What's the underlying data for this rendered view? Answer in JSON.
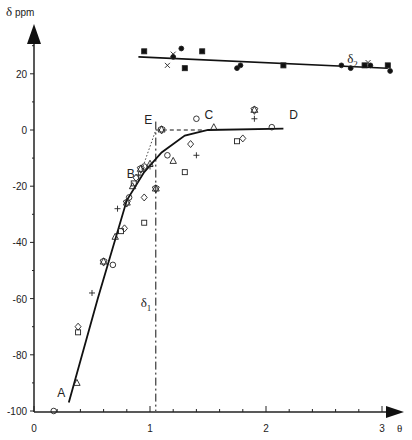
{
  "chart_data": {
    "type": "scatter",
    "title": "",
    "xlabel": "θ",
    "ylabel": "δ ppm",
    "xlim": [
      0,
      3.2
    ],
    "ylim": [
      -100,
      30
    ],
    "x_ticks": [
      "0",
      "1",
      "2",
      "3"
    ],
    "y_ticks": [
      "20",
      "0",
      "-20",
      "-40",
      "-60",
      "-80",
      "-100"
    ],
    "grid": false,
    "annotations": [
      {
        "label": "A",
        "x": 0.2,
        "y": -95
      },
      {
        "label": "B",
        "x": 0.8,
        "y": -17
      },
      {
        "label": "C",
        "x": 1.47,
        "y": 4
      },
      {
        "label": "D",
        "x": 2.2,
        "y": 4
      },
      {
        "label": "E",
        "x": 0.95,
        "y": 2
      },
      {
        "label": "δ1",
        "x": 0.92,
        "y": -63
      },
      {
        "label": "δ2",
        "x": 2.7,
        "y": 24
      }
    ],
    "series": [
      {
        "name": "δ1 fit",
        "kind": "line",
        "points": [
          [
            0.3,
            -97
          ],
          [
            0.55,
            -60
          ],
          [
            0.8,
            -25
          ],
          [
            0.95,
            -15
          ],
          [
            1.1,
            -8
          ],
          [
            1.3,
            -2
          ],
          [
            1.5,
            0
          ],
          [
            2.15,
            0.5
          ]
        ]
      },
      {
        "name": "δ2 fit",
        "kind": "line",
        "points": [
          [
            0.9,
            26
          ],
          [
            3.05,
            22
          ]
        ]
      },
      {
        "name": "extrapolation dashed",
        "kind": "line",
        "points": [
          [
            1.05,
            0
          ],
          [
            1.45,
            0
          ]
        ]
      },
      {
        "name": "E vertical dash-dot",
        "kind": "line",
        "points": [
          [
            1.05,
            3
          ],
          [
            1.05,
            -100
          ]
        ]
      },
      {
        "name": "δ1 data",
        "kind": "scatter",
        "points": [
          [
            0.17,
            -100
          ],
          [
            0.37,
            -90
          ],
          [
            0.38,
            -72
          ],
          [
            0.38,
            -70
          ],
          [
            0.5,
            -58
          ],
          [
            0.6,
            -47
          ],
          [
            0.68,
            -48
          ],
          [
            0.7,
            -38
          ],
          [
            0.75,
            -36
          ],
          [
            0.78,
            -35
          ],
          [
            0.72,
            -28
          ],
          [
            0.8,
            -26
          ],
          [
            0.82,
            -24
          ],
          [
            0.85,
            -20
          ],
          [
            0.86,
            -19
          ],
          [
            0.88,
            -17
          ],
          [
            0.9,
            -16
          ],
          [
            0.92,
            -14
          ],
          [
            0.95,
            -13
          ],
          [
            1.0,
            -12
          ],
          [
            0.95,
            -33
          ],
          [
            0.95,
            -24
          ],
          [
            1.0,
            -13
          ],
          [
            1.05,
            -21
          ],
          [
            1.15,
            -9
          ],
          [
            1.2,
            -11
          ],
          [
            1.3,
            -15
          ],
          [
            1.35,
            -5
          ],
          [
            1.4,
            -9
          ],
          [
            1.1,
            0
          ],
          [
            1.4,
            4
          ],
          [
            1.55,
            1
          ],
          [
            1.75,
            -4
          ],
          [
            1.8,
            -3
          ],
          [
            1.9,
            4
          ],
          [
            1.9,
            7
          ],
          [
            2.05,
            1
          ]
        ]
      },
      {
        "name": "δ2 data",
        "kind": "scatter",
        "points": [
          [
            0.95,
            28
          ],
          [
            1.2,
            27
          ],
          [
            1.27,
            29
          ],
          [
            1.45,
            28
          ],
          [
            1.2,
            26
          ],
          [
            1.15,
            23
          ],
          [
            1.3,
            22
          ],
          [
            1.75,
            22
          ],
          [
            1.78,
            23
          ],
          [
            2.15,
            23
          ],
          [
            2.65,
            23
          ],
          [
            2.73,
            22
          ],
          [
            2.85,
            23
          ],
          [
            2.88,
            24
          ],
          [
            2.9,
            23
          ],
          [
            3.05,
            23
          ],
          [
            3.07,
            21
          ]
        ]
      }
    ]
  },
  "axes": {
    "y_label_delta": "δ",
    "y_label_unit": "ppm",
    "x_label": "θ"
  }
}
